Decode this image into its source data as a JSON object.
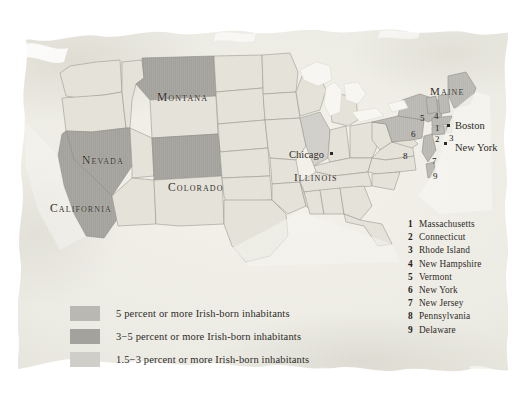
{
  "map": {
    "title": "Irish-born inhabitants of the United States",
    "paper_color": "#ecebe3",
    "ink_color": "#2f2c28"
  },
  "shading": {
    "high_label": "5 percent or more",
    "high_color": "#b9b8b2",
    "mid_label": "3-5 percent",
    "mid_color": "#a3a29c",
    "low_label": "1.5-3 percent",
    "low_color": "#cfcec8",
    "unshaded_color": "#e3e1d8",
    "water_color": "#f7f6f1"
  },
  "state_labels": [
    {
      "name": "Montana",
      "text": "Montana",
      "x": 157,
      "y": 92
    },
    {
      "name": "Nevada",
      "text": "Nevada",
      "x": 82,
      "y": 155
    },
    {
      "name": "Colorado",
      "text": "Colorado",
      "x": 168,
      "y": 182
    },
    {
      "name": "California",
      "text": "California",
      "x": 50,
      "y": 203
    },
    {
      "name": "Illinois",
      "text": "Illinois",
      "x": 294,
      "y": 172
    },
    {
      "name": "Maine",
      "text": "Maine",
      "x": 430,
      "y": 86
    }
  ],
  "city_labels": [
    {
      "name": "Chicago",
      "text": "Chicago",
      "x": 289,
      "y": 150,
      "dot_x": 330,
      "dot_y": 152
    },
    {
      "name": "Boston",
      "text": "Boston",
      "x": 455,
      "y": 121,
      "dot_x": 447,
      "dot_y": 124
    },
    {
      "name": "New York",
      "text": "New York",
      "x": 455,
      "y": 143,
      "dot_x": 444,
      "dot_y": 142
    }
  ],
  "map_numbers": [
    {
      "num": "1",
      "x": 435,
      "y": 124
    },
    {
      "num": "2",
      "x": 435,
      "y": 135
    },
    {
      "num": "3",
      "x": 449,
      "y": 134
    },
    {
      "num": "4",
      "x": 434,
      "y": 112
    },
    {
      "num": "5",
      "x": 420,
      "y": 114
    },
    {
      "num": "6",
      "x": 411,
      "y": 130
    },
    {
      "num": "7",
      "x": 432,
      "y": 157
    },
    {
      "num": "8",
      "x": 403,
      "y": 152
    },
    {
      "num": "9",
      "x": 433,
      "y": 172
    }
  ],
  "key_list": {
    "name": "numbered-state-key",
    "items": [
      {
        "num": "1",
        "name": "Massachusetts"
      },
      {
        "num": "2",
        "name": "Connecticut"
      },
      {
        "num": "3",
        "name": "Rhode Island"
      },
      {
        "num": "4",
        "name": "New Hampshire"
      },
      {
        "num": "5",
        "name": "Vermont"
      },
      {
        "num": "6",
        "name": "New York"
      },
      {
        "num": "7",
        "name": "New Jersey"
      },
      {
        "num": "8",
        "name": "Pennsylvania"
      },
      {
        "num": "9",
        "name": "Delaware"
      }
    ]
  },
  "legend": {
    "name": "shading-legend",
    "items": [
      {
        "color": "#b9b8b2",
        "text": "5 percent or more Irish-born inhabitants"
      },
      {
        "color": "#a3a29c",
        "text": "3−5 percent or more Irish-born inhabitants"
      },
      {
        "color": "#cfcec8",
        "text": "1.5−3 percent or more Irish-born inhabitants"
      }
    ]
  }
}
